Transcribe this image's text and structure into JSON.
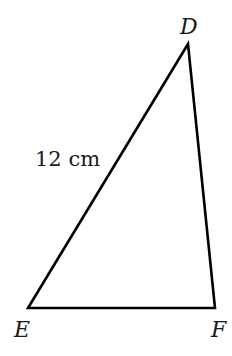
{
  "diagram": {
    "type": "triangle",
    "vertices": [
      {
        "name": "D",
        "x": 188,
        "y": 44,
        "label_x": 180,
        "label_y": 34
      },
      {
        "name": "E",
        "x": 28,
        "y": 308,
        "label_x": 14,
        "label_y": 337
      },
      {
        "name": "F",
        "x": 215,
        "y": 308,
        "label_x": 211,
        "label_y": 337
      }
    ],
    "sides": [
      {
        "from": "D",
        "to": "E",
        "label": "12 cm"
      },
      {
        "from": "E",
        "to": "F",
        "label": ""
      },
      {
        "from": "F",
        "to": "D",
        "label": ""
      }
    ],
    "side_label_de": "12 cm",
    "stroke_color": "#000000"
  }
}
